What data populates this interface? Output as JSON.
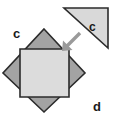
{
  "figure": {
    "background_color": "#ffffff",
    "width": 115,
    "height": 119,
    "labels": {
      "outer_diamond_label": "c",
      "triangle_label": "c",
      "corner_label": "d"
    },
    "shapes": {
      "diamond": {
        "name": "rotated-square",
        "fill_color": "#a3a3a3",
        "stroke_color": "#2b2b2b",
        "points": "44,29 85,73 44,112 3,73"
      },
      "inner_square": {
        "name": "inner-square",
        "fill_color": "#dcdcdc",
        "stroke_color": "#2b2b2b",
        "points": "20,49 69,49 69,97 20,97"
      },
      "triangle": {
        "name": "right-triangle",
        "fill_color": "#d9d9d9",
        "stroke_color": "#2b2b2b",
        "points": "64,8 108,8 108,48"
      },
      "arrow": {
        "name": "southwest-arrow",
        "color": "#9a9a9a",
        "from_x": 80,
        "from_y": 33,
        "to_x": 63,
        "to_y": 50
      }
    },
    "label_positions": {
      "outer_diamond_label_x": 13,
      "outer_diamond_label_y": 38,
      "triangle_label_x": 89,
      "triangle_label_y": 31,
      "corner_label_x": 93,
      "corner_label_y": 111
    }
  }
}
